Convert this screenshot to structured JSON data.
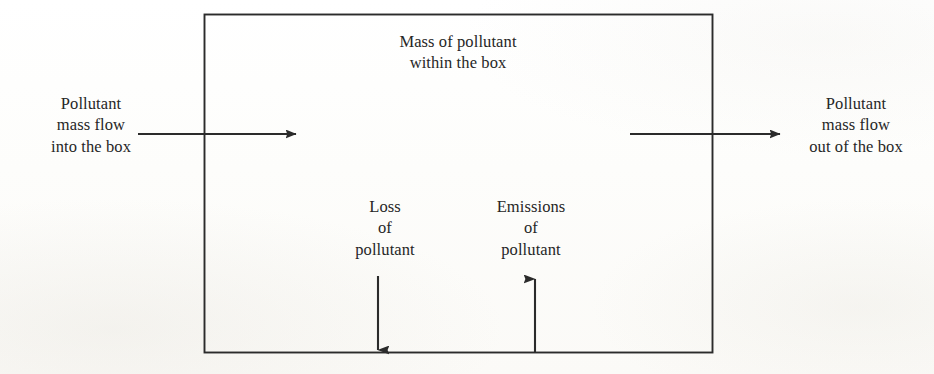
{
  "diagram": {
    "background_color": "#fdfdfb",
    "line_color": "#2b2b2b",
    "text_color": "#262626",
    "box": {
      "label_line1": "Mass of pollutant",
      "label_line2": "within the box",
      "fill": "none",
      "stroke": "#2b2b2b"
    },
    "inflow": {
      "label_line1": "Pollutant",
      "label_line2": "mass flow",
      "label_line3": "into the box",
      "direction": "right",
      "arrow_name": "inflow-arrow"
    },
    "outflow": {
      "label_line1": "Pollutant",
      "label_line2": "mass flow",
      "label_line3": "out of the box",
      "direction": "right",
      "arrow_name": "outflow-arrow"
    },
    "loss": {
      "label_line1": "Loss",
      "label_line2": "of",
      "label_line3": "pollutant",
      "direction": "down",
      "arrow_name": "loss-arrow"
    },
    "emissions": {
      "label_line1": "Emissions",
      "label_line2": "of",
      "label_line3": "pollutant",
      "direction": "up",
      "arrow_name": "emissions-arrow"
    }
  }
}
